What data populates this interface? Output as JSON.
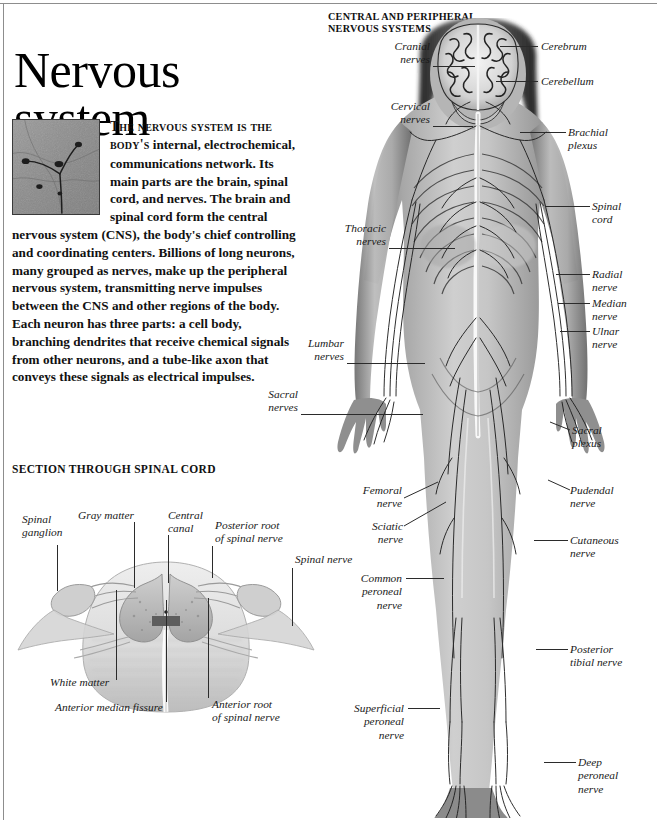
{
  "page": {
    "title": "Nervous\nsystem",
    "intro_lead": "The nervous system is the body's",
    "intro_body": " internal, electrochemical, communications network. Its main parts are the brain, spinal cord, and nerves. The brain and spinal cord form the central nervous system (CNS), the body's chief controlling and coordinating centers. Billions of long neurons, many grouped as nerves, make up the peripheral nervous system, transmitting nerve impulses between the CNS and other regions of the body. Each neuron has three parts: a cell body, branching dendrites that receive chemical signals from other neurons, and a tube-like axon that conveys these signals as electrical impulses.",
    "micrograph_caption": "neuron-micrograph"
  },
  "figures": {
    "body": {
      "heading": "CENTRAL AND PERIPHERAL\nNERVOUS SYSTEMS",
      "labels_left": [
        {
          "id": "cranial-nerves",
          "text": "Cranial\nnerves"
        },
        {
          "id": "cervical-nerves",
          "text": "Cervical\nnerves"
        },
        {
          "id": "thoracic-nerves",
          "text": "Thoracic\nnerves"
        },
        {
          "id": "lumbar-nerves",
          "text": "Lumbar\nnerves"
        },
        {
          "id": "sacral-nerves",
          "text": "Sacral\nnerves"
        },
        {
          "id": "femoral-nerve",
          "text": "Femoral\nnerve"
        },
        {
          "id": "sciatic-nerve",
          "text": "Sciatic\nnerve"
        },
        {
          "id": "common-peroneal-nerve",
          "text": "Common\nperoneal\nnerve"
        },
        {
          "id": "superficial-peroneal-nerve",
          "text": "Superficial\nperoneal\nnerve"
        }
      ],
      "labels_right": [
        {
          "id": "cerebrum",
          "text": "Cerebrum"
        },
        {
          "id": "cerebellum",
          "text": "Cerebellum"
        },
        {
          "id": "brachial-plexus",
          "text": "Brachial\nplexus"
        },
        {
          "id": "spinal-cord",
          "text": "Spinal\ncord"
        },
        {
          "id": "radial-nerve",
          "text": "Radial\nnerve"
        },
        {
          "id": "median-nerve",
          "text": "Median\nnerve"
        },
        {
          "id": "ulnar-nerve",
          "text": "Ulnar\nnerve"
        },
        {
          "id": "sacral-plexus",
          "text": "Sacral\nplexus"
        },
        {
          "id": "pudendal-nerve",
          "text": "Pudendal\nnerve"
        },
        {
          "id": "cutaneous-nerve",
          "text": "Cutaneous\nnerve"
        },
        {
          "id": "posterior-tibial-nerve",
          "text": "Posterior\ntibial nerve"
        },
        {
          "id": "deep-peroneal-nerve",
          "text": "Deep\nperoneal\nnerve"
        }
      ]
    },
    "spinal_cord_section": {
      "heading": "SECTION THROUGH SPINAL CORD",
      "labels": [
        {
          "id": "spinal-ganglion",
          "text": "Spinal\nganglion"
        },
        {
          "id": "gray-matter",
          "text": "Gray matter"
        },
        {
          "id": "central-canal",
          "text": "Central\ncanal"
        },
        {
          "id": "posterior-root-of-spinal-nerve",
          "text": "Posterior root\nof spinal nerve"
        },
        {
          "id": "spinal-nerve",
          "text": "Spinal nerve"
        },
        {
          "id": "white-matter",
          "text": "White matter"
        },
        {
          "id": "anterior-median-fissure",
          "text": "Anterior median fissure"
        },
        {
          "id": "anterior-root-of-spinal-nerve",
          "text": "Anterior root\nof spinal nerve"
        }
      ]
    }
  },
  "colors": {
    "ink": "#111111",
    "rule": "#8d8d8d",
    "leader": "#2b2b2b",
    "paper": "#ffffff"
  }
}
